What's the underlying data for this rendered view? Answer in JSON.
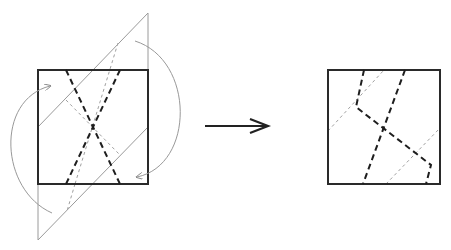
{
  "diagram": {
    "title": "Origami fold step: fold corners along diagonals, result square",
    "colors": {
      "outline": "#2a2a2a",
      "thin_line": "#9a9a9a",
      "dash_thick": "#1e1e1e",
      "dash_thin": "#a0a0a0",
      "arrow": "#222222"
    },
    "left_figure": {
      "square": {
        "x": 38,
        "y": 70,
        "w": 110,
        "h": 114
      },
      "fold_flaps": [
        {
          "points": "148,13 148,130 38,127 38,127"
        },
        {
          "points": "38,184 38,240 148,127"
        }
      ],
      "thin_lines": [
        {
          "x1": 148,
          "y1": 13,
          "x2": 38,
          "y2": 127
        },
        {
          "x1": 148,
          "y1": 13,
          "x2": 148,
          "y2": 70
        },
        {
          "x1": 38,
          "y1": 240,
          "x2": 148,
          "y2": 127
        },
        {
          "x1": 38,
          "y1": 184,
          "x2": 38,
          "y2": 240
        }
      ],
      "thick_dashes": [
        {
          "x1": 66,
          "y1": 70,
          "x2": 120,
          "y2": 184
        },
        {
          "x1": 120,
          "y1": 70,
          "x2": 66,
          "y2": 184
        }
      ],
      "thin_dashes": [
        {
          "x1": 118,
          "y1": 43,
          "x2": 75,
          "y2": 184
        },
        {
          "x1": 75,
          "y1": 184,
          "x2": 67,
          "y2": 211
        },
        {
          "x1": 66,
          "y1": 100,
          "x2": 120,
          "y2": 155
        }
      ],
      "curved_arrows": [
        {
          "d": "M 52 213 C 0 190, -5 100, 50 86",
          "head": "50,86"
        },
        {
          "d": "M 135 41 C 195 60, 195 165, 137 177",
          "head": "137,177"
        }
      ]
    },
    "arrow": {
      "x1": 205,
      "y1": 126,
      "x2": 268,
      "y2": 126,
      "label": "becomes"
    },
    "right_figure": {
      "square": {
        "x": 328,
        "y": 70,
        "w": 112,
        "h": 114
      },
      "thick_dashes": [
        {
          "points": "364,70 356,107 431,165 426,184"
        },
        {
          "points": "405,70 363,184"
        }
      ],
      "thin_dashes": [
        {
          "x1": 328,
          "y1": 131,
          "x2": 384,
          "y2": 70
        },
        {
          "x1": 386,
          "y1": 184,
          "x2": 440,
          "y2": 128
        }
      ]
    }
  }
}
